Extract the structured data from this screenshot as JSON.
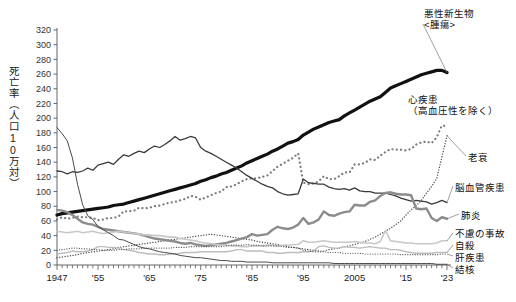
{
  "chart_data": {
    "type": "line",
    "title": "",
    "ylabel": "死亡率（人口10万対）",
    "xlabel": "",
    "ylim": [
      0,
      320
    ],
    "xlim": [
      1947,
      2023
    ],
    "yticks": [
      0,
      20,
      40,
      60,
      80,
      100,
      120,
      140,
      160,
      180,
      200,
      220,
      240,
      260,
      280,
      300,
      320
    ],
    "xticks": [
      1947,
      1955,
      1965,
      1975,
      1985,
      1995,
      2005,
      2015,
      2023
    ],
    "xtick_labels": [
      "1947",
      "'55",
      "'65",
      "'75",
      "'85",
      "'95",
      "2005",
      "'15",
      "'23"
    ],
    "grid": false,
    "legend": "inline-right-labels",
    "x": [
      1947,
      1948,
      1949,
      1950,
      1951,
      1952,
      1953,
      1954,
      1955,
      1956,
      1957,
      1958,
      1959,
      1960,
      1961,
      1962,
      1963,
      1964,
      1965,
      1966,
      1967,
      1968,
      1969,
      1970,
      1971,
      1972,
      1973,
      1974,
      1975,
      1976,
      1977,
      1978,
      1979,
      1980,
      1981,
      1982,
      1983,
      1984,
      1985,
      1986,
      1987,
      1988,
      1989,
      1990,
      1991,
      1992,
      1993,
      1994,
      1995,
      1996,
      1997,
      1998,
      1999,
      2000,
      2001,
      2002,
      2003,
      2004,
      2005,
      2006,
      2007,
      2008,
      2009,
      2010,
      2011,
      2012,
      2013,
      2014,
      2015,
      2016,
      2017,
      2018,
      2019,
      2020,
      2021,
      2022,
      2023
    ],
    "series": [
      {
        "name": "悪性新生物<腫瘍>",
        "label": "悪性新生物\n<腫瘍>",
        "style": "solid-thick",
        "color": "#111111",
        "width": 3.2,
        "values": [
          68,
          70,
          71,
          72,
          73,
          74,
          75,
          76,
          77,
          78,
          79,
          81,
          82,
          83,
          85,
          87,
          89,
          91,
          93,
          95,
          97,
          99,
          101,
          103,
          105,
          107,
          109,
          111,
          114,
          116,
          119,
          121,
          124,
          126,
          129,
          132,
          135,
          139,
          142,
          145,
          148,
          151,
          155,
          158,
          162,
          166,
          168,
          171,
          177,
          181,
          185,
          188,
          191,
          194,
          196,
          198,
          203,
          207,
          211,
          215,
          219,
          223,
          226,
          229,
          235,
          241,
          244,
          247,
          250,
          253,
          256,
          259,
          261,
          263,
          265,
          265,
          262
        ],
        "label_x": 425,
        "label_y": 14
      },
      {
        "name": "心疾患（高血圧性を除く）",
        "label": "心疾患\n（高血圧性を除く）",
        "style": "dotted-coarse",
        "color": "#7a7a7a",
        "width": 2.2,
        "values": [
          62,
          65,
          63,
          64,
          66,
          65,
          65,
          64,
          61,
          62,
          64,
          64,
          66,
          73,
          73,
          74,
          78,
          77,
          78,
          80,
          81,
          83,
          85,
          86,
          88,
          90,
          94,
          93,
          89,
          92,
          95,
          98,
          100,
          106,
          107,
          110,
          114,
          117,
          118,
          118,
          120,
          122,
          128,
          134,
          138,
          142,
          146,
          152,
          112,
          110,
          111,
          114,
          121,
          117,
          117,
          121,
          126,
          126,
          137,
          137,
          139,
          144,
          143,
          149,
          154,
          158,
          157,
          157,
          156,
          158,
          164,
          167,
          168,
          166,
          174,
          190,
          189
        ],
        "label_x": 420,
        "label_y": 98
      },
      {
        "name": "老衰",
        "label": "老衰",
        "style": "dotted-fine",
        "color": "#4a4a4a",
        "width": 1.3,
        "values": [
          10,
          11,
          12,
          13,
          14,
          16,
          17,
          18,
          19,
          20,
          21,
          22,
          24,
          25,
          26,
          27,
          28,
          29,
          30,
          31,
          32,
          33,
          34,
          35,
          36,
          37,
          38,
          39,
          40,
          41,
          42,
          41,
          40,
          39,
          38,
          37,
          36,
          35,
          34,
          32,
          31,
          30,
          29,
          28,
          26,
          25,
          24,
          23,
          22,
          21,
          20,
          19,
          19,
          21,
          22,
          23,
          25,
          26,
          28,
          30,
          32,
          35,
          38,
          42,
          46,
          50,
          55,
          60,
          68,
          75,
          81,
          88,
          98,
          107,
          118,
          147,
          176
        ],
        "label_x": 455,
        "label_y": 152
      },
      {
        "name": "脳血管疾患",
        "label": "脳血管疾患",
        "style": "solid-thin",
        "color": "#3a3a3a",
        "width": 1.3,
        "values": [
          128,
          127,
          124,
          127,
          126,
          128,
          132,
          129,
          136,
          138,
          140,
          137,
          144,
          150,
          148,
          152,
          155,
          153,
          158,
          162,
          160,
          164,
          169,
          175,
          170,
          172,
          175,
          173,
          160,
          155,
          152,
          148,
          144,
          140,
          136,
          132,
          127,
          122,
          118,
          114,
          110,
          107,
          105,
          100,
          97,
          95,
          96,
          97,
          117,
          112,
          111,
          110,
          110,
          106,
          104,
          103,
          104,
          102,
          105,
          101,
          100,
          100,
          98,
          98,
          98,
          96,
          94,
          91,
          89,
          87,
          88,
          87,
          86,
          83,
          85,
          88,
          85
        ],
        "label_x": 455,
        "label_y": 186
      },
      {
        "name": "肺炎",
        "label": "肺炎",
        "style": "solid-medium-gray",
        "color": "#8c8c8c",
        "width": 2.4,
        "values": [
          75,
          74,
          72,
          68,
          63,
          58,
          56,
          55,
          52,
          49,
          48,
          47,
          46,
          45,
          44,
          43,
          42,
          40,
          38,
          36,
          35,
          34,
          33,
          32,
          30,
          29,
          30,
          28,
          27,
          26,
          27,
          28,
          29,
          30,
          32,
          34,
          36,
          38,
          42,
          40,
          41,
          42,
          48,
          52,
          50,
          49,
          51,
          55,
          64,
          56,
          58,
          62,
          73,
          68,
          67,
          70,
          72,
          73,
          82,
          81,
          81,
          86,
          88,
          94,
          98,
          99,
          97,
          96,
          96,
          95,
          77,
          76,
          77,
          64,
          60,
          65,
          63
        ],
        "label_x": 455,
        "label_y": 213
      },
      {
        "name": "不慮の事故",
        "label": "不慮の事故",
        "style": "solid-light",
        "color": "#c8c8c8",
        "width": 1.6,
        "values": [
          46,
          45,
          44,
          45,
          46,
          44,
          45,
          46,
          44,
          43,
          44,
          45,
          46,
          45,
          44,
          43,
          42,
          41,
          41,
          40,
          40,
          39,
          38,
          38,
          36,
          35,
          34,
          33,
          31,
          30,
          29,
          28,
          27,
          27,
          26,
          26,
          25,
          25,
          26,
          26,
          26,
          27,
          27,
          26,
          27,
          27,
          28,
          28,
          33,
          31,
          31,
          32,
          33,
          32,
          31,
          31,
          31,
          31,
          32,
          31,
          30,
          30,
          29,
          32,
          47,
          33,
          32,
          31,
          30,
          30,
          29,
          29,
          29,
          29,
          30,
          33,
          33
        ],
        "label_x": 455,
        "label_y": 232
      },
      {
        "name": "自殺",
        "label": "自殺",
        "style": "solid-light2",
        "color": "#bdbdbd",
        "width": 1.4,
        "values": [
          15,
          16,
          17,
          19,
          18,
          18,
          19,
          21,
          25,
          25,
          24,
          24,
          23,
          21,
          20,
          19,
          17,
          16,
          15,
          15,
          14,
          14,
          15,
          15,
          16,
          17,
          17,
          17,
          18,
          18,
          18,
          18,
          18,
          18,
          19,
          21,
          21,
          19,
          19,
          19,
          19,
          17,
          17,
          16,
          16,
          17,
          17,
          17,
          18,
          18,
          19,
          25,
          26,
          24,
          23,
          23,
          25,
          24,
          24,
          23,
          24,
          25,
          24,
          23,
          23,
          21,
          21,
          20,
          18,
          17,
          16,
          16,
          16,
          16,
          17,
          17,
          17
        ],
        "label_x": 455,
        "label_y": 243
      },
      {
        "name": "肝疾患",
        "label": "肝疾患",
        "style": "dotted-fine2",
        "color": "#555555",
        "width": 1.2,
        "values": [
          20,
          21,
          22,
          23,
          23,
          22,
          22,
          21,
          21,
          20,
          20,
          20,
          21,
          21,
          22,
          22,
          22,
          23,
          23,
          23,
          23,
          23,
          23,
          24,
          24,
          24,
          25,
          25,
          25,
          25,
          25,
          25,
          25,
          26,
          27,
          27,
          27,
          28,
          27,
          27,
          26,
          26,
          26,
          26,
          25,
          24,
          24,
          23,
          20,
          19,
          18,
          18,
          18,
          17,
          17,
          17,
          16,
          16,
          16,
          16,
          15,
          15,
          15,
          15,
          15,
          15,
          15,
          14,
          14,
          14,
          14,
          14,
          14,
          14,
          14,
          15,
          15
        ],
        "label_x": 455,
        "label_y": 253
      },
      {
        "name": "結核",
        "label": "結核",
        "style": "solid-thin2",
        "color": "#4a4a4a",
        "width": 1.0,
        "values": [
          187,
          179,
          169,
          146,
          110,
          82,
          67,
          62,
          52,
          48,
          44,
          40,
          35,
          34,
          31,
          28,
          25,
          23,
          22,
          20,
          18,
          17,
          16,
          15,
          13,
          12,
          11,
          10,
          10,
          9,
          8,
          7,
          6,
          6,
          5,
          5,
          5,
          4,
          4,
          4,
          4,
          4,
          3,
          3,
          3,
          3,
          3,
          3,
          3,
          3,
          3,
          3,
          3,
          3,
          2,
          2,
          2,
          2,
          2,
          2,
          2,
          2,
          2,
          2,
          2,
          2,
          2,
          2,
          2,
          2,
          2,
          2,
          2,
          2,
          1,
          1,
          1
        ],
        "label_x": 455,
        "label_y": 263
      }
    ]
  },
  "axis": {
    "y_label": "死亡率（人口10万対）",
    "y_tick_labels": [
      "0",
      "20",
      "40",
      "60",
      "80",
      "100",
      "120",
      "140",
      "160",
      "180",
      "200",
      "220",
      "240",
      "260",
      "280",
      "300",
      "320"
    ],
    "x_tick_labels": [
      "1947",
      "'55",
      "'65",
      "'75",
      "'85",
      "'95",
      "2005",
      "'15",
      "'23"
    ]
  },
  "labels": {
    "cancer_line1": "悪性新生物",
    "cancer_line2": "<腫瘍>",
    "heart_line1": "心疾患",
    "heart_line2": "（高血圧性を除く）",
    "senility": "老衰",
    "cerebro": "脳血管疾患",
    "pneumonia": "肺炎",
    "accident": "不慮の事故",
    "suicide": "自殺",
    "liver": "肝疾患",
    "tuberculosis": "結核"
  },
  "footer": {
    "note": ""
  },
  "colors": {
    "cancer": "#111111",
    "heart": "#7a7a7a",
    "senility": "#4a4a4a",
    "cerebro": "#3a3a3a",
    "pneumonia": "#8c8c8c",
    "accident": "#c8c8c8",
    "suicide": "#bdbdbd",
    "liver": "#555555",
    "tuberculosis": "#4a4a4a",
    "axis": "#555555"
  }
}
